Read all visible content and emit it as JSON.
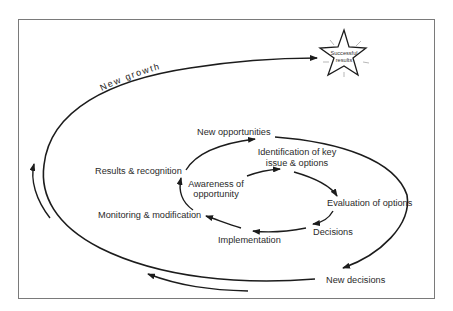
{
  "diagram": {
    "type": "spiral-cycle",
    "outer_label": "New growth",
    "goal": {
      "label_line1": "Successful",
      "label_line2": "results",
      "shape": "star-icon"
    },
    "inner_cycle": [
      {
        "id": "awareness",
        "line1": "Awareness of",
        "line2": "opportunity"
      },
      {
        "id": "identification",
        "line1": "Identification of key",
        "line2": "issue & options"
      },
      {
        "id": "evaluation",
        "line1": "Evaluation of options"
      },
      {
        "id": "decisions",
        "line1": "Decisions"
      },
      {
        "id": "implementation",
        "line1": "Implementation"
      },
      {
        "id": "monitoring",
        "line1": "Monitoring & modification"
      },
      {
        "id": "results",
        "line1": "Results & recognition"
      }
    ],
    "middle_cycle": [
      {
        "id": "new_opportunities",
        "line1": "New opportunities"
      },
      {
        "id": "new_decisions",
        "line1": "New decisions"
      }
    ],
    "edges": [
      [
        "awareness",
        "identification"
      ],
      [
        "identification",
        "evaluation"
      ],
      [
        "evaluation",
        "decisions"
      ],
      [
        "decisions",
        "implementation"
      ],
      [
        "implementation",
        "monitoring"
      ],
      [
        "monitoring",
        "results"
      ],
      [
        "results",
        "new_opportunities"
      ],
      [
        "new_opportunities",
        "new_decisions"
      ],
      [
        "new_decisions",
        "new_growth"
      ],
      [
        "new_growth",
        "successful_results"
      ]
    ]
  }
}
